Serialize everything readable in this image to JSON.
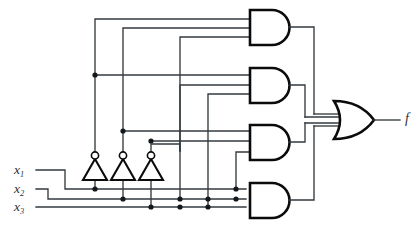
{
  "diagram": {
    "type": "logic-circuit",
    "inputs": [
      {
        "id": "x1",
        "label": "x",
        "subscript": "1",
        "y": 170
      },
      {
        "id": "x2",
        "label": "x",
        "subscript": "2",
        "y": 189
      },
      {
        "id": "x3",
        "label": "x",
        "subscript": "3",
        "y": 207
      }
    ],
    "output": {
      "id": "f",
      "label": "f",
      "y": 120
    },
    "inverters": [
      {
        "id": "inv1",
        "name": "not-x1",
        "x": 95
      },
      {
        "id": "inv2",
        "name": "not-x2",
        "x": 123
      },
      {
        "id": "inv3",
        "name": "not-x3",
        "x": 151
      }
    ],
    "and_gates": [
      {
        "id": "and1",
        "name": "and-gate-1",
        "y": 27,
        "inputs": [
          "x1'",
          "x2'",
          "x3'"
        ]
      },
      {
        "id": "and2",
        "name": "and-gate-2",
        "y": 85,
        "inputs": [
          "x1'",
          "x2",
          "x3"
        ]
      },
      {
        "id": "and3",
        "name": "and-gate-3",
        "y": 142,
        "inputs": [
          "x1",
          "x2'",
          "x3"
        ]
      },
      {
        "id": "and4",
        "name": "and-gate-4",
        "y": 200,
        "inputs": [
          "x1",
          "x2",
          "x3'"
        ]
      }
    ],
    "or_gate": {
      "id": "or1",
      "name": "or-gate",
      "y": 120,
      "input_count": 4
    },
    "junction_count": 14
  }
}
